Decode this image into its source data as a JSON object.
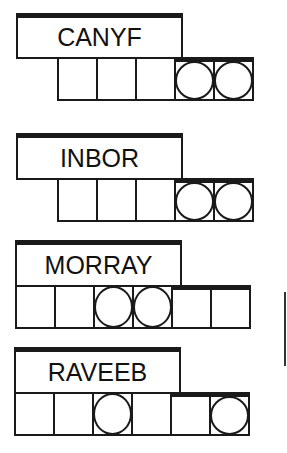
{
  "puzzle": {
    "type": "word-jumble",
    "jumbles": [
      {
        "scrambled": "CANYF",
        "letter_count": 5,
        "circled_positions": [
          4,
          5
        ]
      },
      {
        "scrambled": "INBOR",
        "letter_count": 5,
        "circled_positions": [
          4,
          5
        ]
      },
      {
        "scrambled": "MORRAY",
        "letter_count": 6,
        "circled_positions": [
          3,
          4
        ]
      },
      {
        "scrambled": "RAVEEB",
        "letter_count": 6,
        "circled_positions": [
          3,
          6
        ]
      }
    ]
  },
  "colors": {
    "ink": "#1a1a1a",
    "background": "#ffffff"
  }
}
